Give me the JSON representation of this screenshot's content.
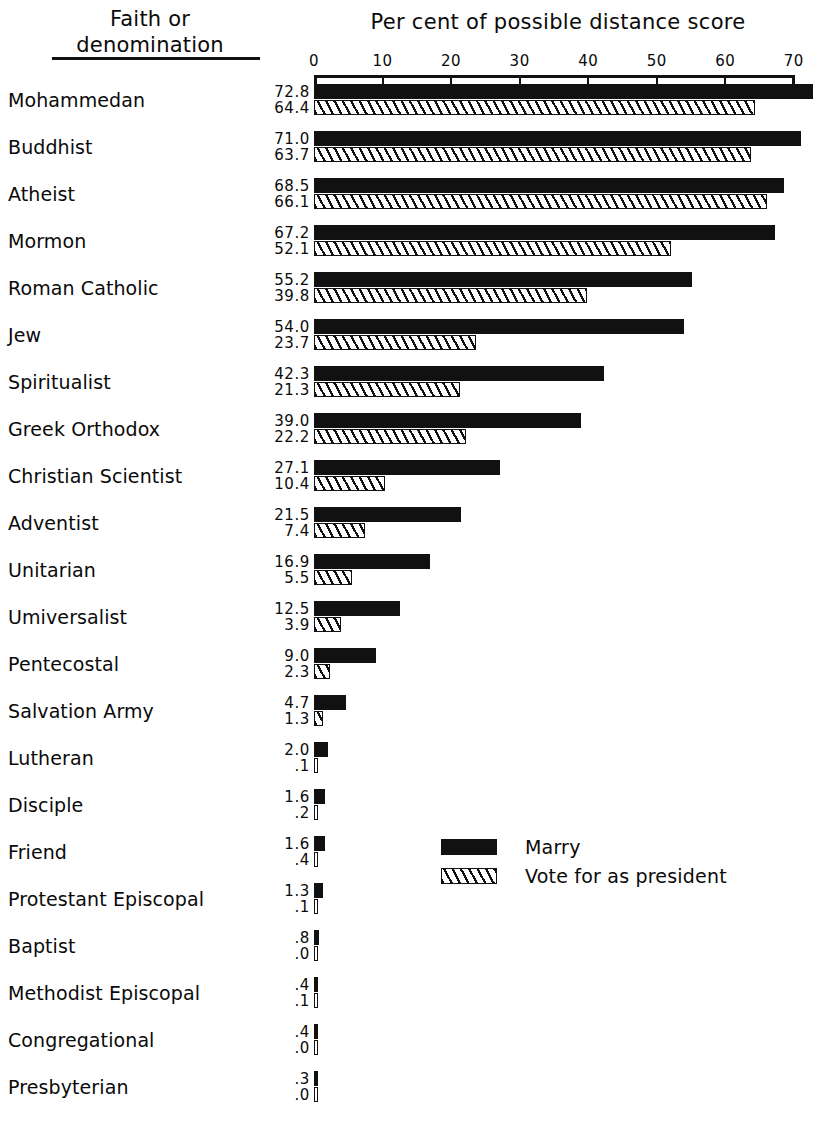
{
  "header": {
    "column_header_line1": "Faith or",
    "column_header_line2": "denomination",
    "chart_title": "Per cent of possible distance score"
  },
  "legend": {
    "items": [
      {
        "label": "Marry",
        "pattern": "solid-black"
      },
      {
        "label": "Vote for as president",
        "pattern": "diagonal-hatch"
      }
    ]
  },
  "axis": {
    "ticks": [
      "0",
      "10",
      "20",
      "30",
      "40",
      "50",
      "60",
      "70"
    ],
    "min": 0,
    "max": 70
  },
  "chart_data": {
    "type": "bar",
    "orientation": "horizontal",
    "title": "Per cent of possible distance score",
    "xlabel": "Per cent of possible distance score",
    "ylabel": "Faith or denomination",
    "xlim": [
      0,
      70
    ],
    "grid": false,
    "legend_position": "center-right",
    "categories": [
      "Mohammedan",
      "Buddhist",
      "Atheist",
      "Mormon",
      "Roman Catholic",
      "Jew",
      "Spiritualist",
      "Greek Orthodox",
      "Christian Scientist",
      "Adventist",
      "Unitarian",
      "Umiversalist",
      "Pentecostal",
      "Salvation Army",
      "Lutheran",
      "Disciple",
      "Friend",
      "Protestant Episcopal",
      "Baptist",
      "Methodist Episcopal",
      "Congregational",
      "Presbyterian"
    ],
    "series": [
      {
        "name": "Marry",
        "values": [
          72.8,
          71.0,
          68.5,
          67.2,
          55.2,
          54.0,
          42.3,
          39.0,
          27.1,
          21.5,
          16.9,
          12.5,
          9.0,
          4.7,
          2.0,
          1.6,
          1.6,
          1.3,
          0.8,
          0.4,
          0.4,
          0.3
        ],
        "labels": [
          "72.8",
          "71.0",
          "68.5",
          "67.2",
          "55.2",
          "54.0",
          "42.3",
          "39.0",
          "27.1",
          "21.5",
          "16.9",
          "12.5",
          "9.0",
          "4.7",
          "2.0",
          "1.6",
          "1.6",
          "1.3",
          ".8",
          ".4",
          ".4",
          ".3"
        ]
      },
      {
        "name": "Vote for as president",
        "values": [
          64.4,
          63.7,
          66.1,
          52.1,
          39.8,
          23.7,
          21.3,
          22.2,
          10.4,
          7.4,
          5.5,
          3.9,
          2.3,
          1.3,
          0.1,
          0.2,
          0.4,
          0.1,
          0.0,
          0.1,
          0.0,
          0.0
        ],
        "labels": [
          "64.4",
          "63.7",
          "66.1",
          "52.1",
          "39.8",
          "23.7",
          "21.3",
          "22.2",
          "10.4",
          "7.4",
          "5.5",
          "3.9",
          "2.3",
          "1.3",
          ".1",
          ".2",
          ".4",
          ".1",
          ".0",
          ".1",
          ".0",
          ".0"
        ]
      }
    ]
  }
}
